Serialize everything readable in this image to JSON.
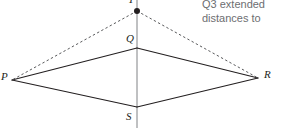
{
  "figure": {
    "type": "geometry-diagram",
    "canvas": {
      "width": 281,
      "height": 128
    },
    "axis_line": {
      "name": "vertical-axis",
      "x": 137,
      "y_top": 0,
      "y_bottom": 128,
      "color": "#808285",
      "style": "solid"
    },
    "vertices": [
      {
        "id": "P",
        "label": "P",
        "x": 12,
        "y": 80,
        "label_x": 1,
        "label_y": 71
      },
      {
        "id": "Q",
        "label": "Q",
        "x": 137,
        "y": 48,
        "label_x": 126,
        "label_y": 33
      },
      {
        "id": "R",
        "label": "R",
        "x": 258,
        "y": 78,
        "label_x": 264,
        "label_y": 69
      },
      {
        "id": "S",
        "label": "S",
        "x": 137,
        "y": 107,
        "label_x": 126,
        "label_y": 111
      },
      {
        "id": "T",
        "label": "T",
        "x": 137,
        "y": 11,
        "label_x": 128,
        "label_y": -6
      }
    ],
    "point_marker": {
      "at": "T",
      "radius": 3,
      "color": "#231f20"
    },
    "solid_edges": [
      {
        "from": "P",
        "to": "Q"
      },
      {
        "from": "Q",
        "to": "R"
      },
      {
        "from": "R",
        "to": "S"
      },
      {
        "from": "S",
        "to": "P"
      }
    ],
    "dashed_edges": [
      {
        "from": "T",
        "to": "P"
      },
      {
        "from": "T",
        "to": "R"
      }
    ],
    "edge_color": "#231f20",
    "dash_color": "#58595b"
  },
  "caption": {
    "lines": [
      "Q3 extended",
      "distances to"
    ],
    "color": "#6d6e71"
  }
}
